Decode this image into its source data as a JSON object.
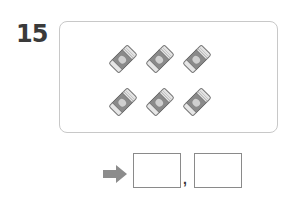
{
  "question": {
    "number": "15",
    "picture": {
      "item_icon": "eraser-icon",
      "count": 6,
      "rows": 2,
      "per_row": 3
    },
    "answer": {
      "arrow_icon": "right-arrow-icon",
      "separator": ",",
      "box1_value": "",
      "box2_value": ""
    }
  },
  "colors": {
    "number": "#3a3a3a",
    "box_border": "#c8c8c8",
    "arrow": "#8c8c8c",
    "answer_border": "#8a8a8a"
  }
}
